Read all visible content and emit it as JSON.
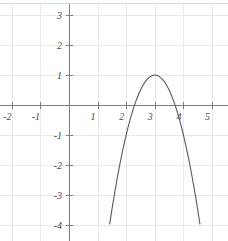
{
  "figure": {
    "width": 228,
    "height": 241,
    "background_color": "#ffffff"
  },
  "style": {
    "grid_color": "#e9e9e9",
    "axis_color": "#7d7d7d",
    "curve_color": "#5a5a5a",
    "label_color": "#4a4a4a",
    "frame_color": "#dcdcdc"
  },
  "geometry": {
    "origin_px": {
      "x": 69,
      "y": 105
    },
    "unit_px": {
      "x": 28.6,
      "y": 29.9
    }
  },
  "chart_data": {
    "type": "line",
    "title": "",
    "xlabel": "",
    "ylabel": "",
    "xlim": [
      -2.4,
      5.4
    ],
    "ylim": [
      -4.5,
      3.5
    ],
    "grid": true,
    "legend": null,
    "x_ticks": [
      -2,
      -1,
      1,
      2,
      3,
      4,
      5
    ],
    "x_tick_labels": [
      "-2",
      "-1",
      "1",
      "2",
      "3",
      "4",
      "5"
    ],
    "y_ticks": [
      3,
      2,
      1,
      -1,
      -2,
      -3,
      -4
    ],
    "y_tick_labels": [
      "3",
      "2",
      "1",
      "-1",
      "-2",
      "-3",
      "-4"
    ],
    "x_grid_values": [
      -2,
      -1,
      0,
      1,
      2,
      3,
      4,
      5
    ],
    "y_grid_values": [
      3,
      2,
      1,
      0,
      -1,
      -2,
      -3,
      -4
    ],
    "series": [
      {
        "name": "parabola",
        "equation": "y = -2(x - 3)^2 + 1",
        "shape": "parabola",
        "opens": "down",
        "vertex": [
          3,
          1
        ],
        "leading_coefficient": -2,
        "roots": [
          2.293,
          3.707
        ],
        "x_domain": [
          1.42,
          4.58
        ],
        "x": [
          1.42,
          1.6,
          1.8,
          2.0,
          2.2,
          2.293,
          2.4,
          2.6,
          2.8,
          3.0,
          3.2,
          3.4,
          3.6,
          3.707,
          3.8,
          4.0,
          4.2,
          4.4,
          4.58
        ],
        "values": [
          -3.99,
          -2.92,
          -1.88,
          -1.0,
          -0.28,
          0,
          0.28,
          0.68,
          0.92,
          1.0,
          0.92,
          0.68,
          0.28,
          0,
          -0.28,
          -1.0,
          -1.88,
          -2.92,
          -3.99
        ]
      }
    ]
  }
}
